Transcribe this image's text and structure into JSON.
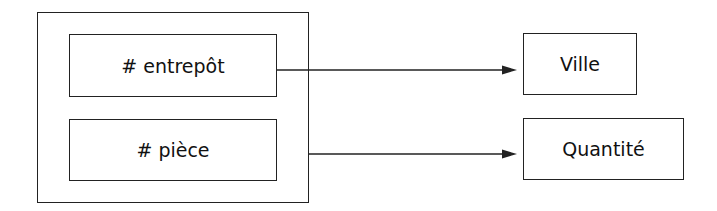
{
  "diagram": {
    "group": {
      "keys": [
        {
          "label": "# entrepôt"
        },
        {
          "label": "# pièce"
        }
      ]
    },
    "attributes": [
      {
        "label": "Ville"
      },
      {
        "label": "Quantité"
      }
    ],
    "edges": [
      {
        "from": "# entrepôt",
        "to": "Ville"
      },
      {
        "from": "group (# entrepôt, # pièce)",
        "to": "Quantité"
      }
    ],
    "stroke_color": "#222222"
  }
}
